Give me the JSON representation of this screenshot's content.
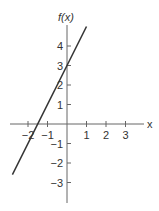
{
  "chart_data": {
    "type": "line",
    "title": "",
    "xlabel": "x",
    "ylabel": "f(x)",
    "xlim": [
      -2.8,
      3.7
    ],
    "ylim": [
      -4,
      5
    ],
    "x_ticks": [
      "-2",
      "-1",
      "1",
      "2",
      "3"
    ],
    "y_ticks": [
      "4",
      "3",
      "2",
      "1",
      "-1",
      "-2",
      "-3"
    ],
    "grid": false,
    "series": [
      {
        "name": "f(x) = 2x + 3",
        "x": [
          -2.8,
          1.0
        ],
        "y": [
          -2.6,
          5.0
        ]
      }
    ]
  },
  "labels": {
    "fx": "f(x)",
    "x": "x"
  }
}
